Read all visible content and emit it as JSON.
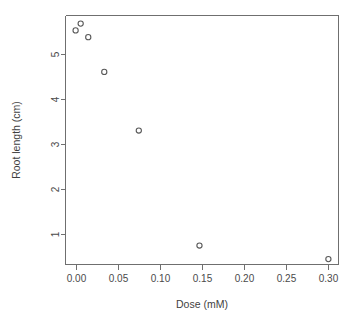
{
  "chart_data": {
    "type": "scatter",
    "title": "",
    "xlabel": "Dose (mM)",
    "ylabel": "Root length (cm)",
    "xlim": [
      -0.012,
      0.312
    ],
    "ylim": [
      0.33,
      5.85
    ],
    "grid": false,
    "legend": null,
    "xticks": [
      "0.00",
      "0.05",
      "0.10",
      "0.15",
      "0.20",
      "0.25",
      "0.30"
    ],
    "xtick_values": [
      0.0,
      0.05,
      0.1,
      0.15,
      0.2,
      0.25,
      0.3
    ],
    "yticks": [
      "1",
      "2",
      "3",
      "4",
      "5"
    ],
    "ytick_values": [
      1,
      2,
      3,
      4,
      5
    ],
    "marker": "open-circle",
    "marker_color": "#585858",
    "x": [
      0.0,
      0.006,
      0.015,
      0.034,
      0.075,
      0.147,
      0.3
    ],
    "y": [
      5.52,
      5.67,
      5.37,
      4.6,
      3.3,
      0.75,
      0.45
    ],
    "points": [
      {
        "x": 0.0,
        "y": 5.52
      },
      {
        "x": 0.006,
        "y": 5.67
      },
      {
        "x": 0.015,
        "y": 5.37
      },
      {
        "x": 0.034,
        "y": 4.6
      },
      {
        "x": 0.075,
        "y": 3.3
      },
      {
        "x": 0.147,
        "y": 0.75
      },
      {
        "x": 0.3,
        "y": 0.45
      }
    ]
  }
}
